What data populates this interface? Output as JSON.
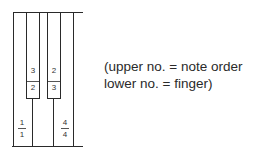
{
  "diagram": {
    "type": "piano-keyboard-fingering",
    "black_keys": [
      {
        "upper": "3",
        "lower": "2"
      },
      {
        "upper": "2",
        "lower": "3"
      }
    ],
    "white_keys": [
      {
        "upper": "1",
        "lower": "1"
      },
      {
        "upper": "4",
        "lower": "4"
      }
    ]
  },
  "legend": {
    "line1": "(upper no. = note order",
    "line2": "lower no. = finger)"
  }
}
